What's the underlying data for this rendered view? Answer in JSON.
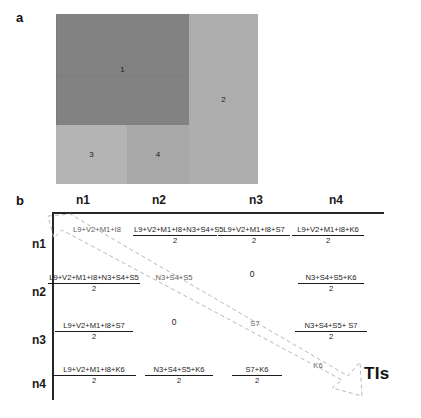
{
  "figure": {
    "panel_a": {
      "label": "a",
      "regions": [
        {
          "id": "1",
          "label": "1",
          "color": "#828282"
        },
        {
          "id": "2",
          "label": "2",
          "color": "#adadad"
        },
        {
          "id": "3",
          "label": "3",
          "color": "#b4b4b4"
        },
        {
          "id": "4",
          "label": "4",
          "color": "#a8a8a8"
        }
      ]
    },
    "panel_b": {
      "label": "b",
      "col_headers": [
        "n1",
        "n2",
        "n3",
        "n4"
      ],
      "row_headers": [
        "n1",
        "n2",
        "n3",
        "n4"
      ],
      "arrow_label": "TIs",
      "cells": [
        [
          {
            "type": "plain",
            "num": "L9+V2+M1+I8",
            "den": ""
          },
          {
            "type": "frac",
            "num": "L9+V2+M1+I8+N3+S4+S5",
            "den": "2"
          },
          {
            "type": "frac",
            "num": "L9+V2+M1+I8+S7",
            "den": "2"
          },
          {
            "type": "frac",
            "num": "L9+V2+M1+I8+K6",
            "den": "2"
          }
        ],
        [
          {
            "type": "frac",
            "num": "L9+V2+M1+I8+N3+S4+S5",
            "den": "2"
          },
          {
            "type": "plain",
            "num": "N3+S4+S5",
            "den": ""
          },
          {
            "type": "zero",
            "num": "0",
            "den": ""
          },
          {
            "type": "frac",
            "num": "N3+S4+S5+K6",
            "den": "2"
          }
        ],
        [
          {
            "type": "frac",
            "num": "L9+V2+M1+I8+S7",
            "den": "2"
          },
          {
            "type": "zero",
            "num": "0",
            "den": ""
          },
          {
            "type": "plain",
            "num": "S7",
            "den": ""
          },
          {
            "type": "frac",
            "num": "N3+S4+S5+ S7",
            "den": "2"
          }
        ],
        [
          {
            "type": "frac",
            "num": "L9+V2+M1+I8+K6",
            "den": "2"
          },
          {
            "type": "frac",
            "num": "N3+S4+S5+K6",
            "den": "2"
          },
          {
            "type": "frac",
            "num": "S7+K6",
            "den": "2"
          },
          {
            "type": "plain",
            "num": "K6",
            "den": ""
          }
        ]
      ]
    }
  }
}
